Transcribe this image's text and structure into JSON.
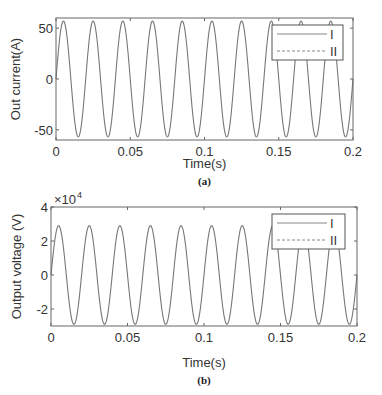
{
  "chart_data": [
    {
      "type": "line",
      "caption": "(a)",
      "title": "",
      "xlabel": "Time(s)",
      "ylabel": "Out current(A)",
      "xlim": [
        0,
        0.2
      ],
      "ylim": [
        -60,
        60
      ],
      "xticks": [
        "0",
        "0.05",
        "0.1",
        "0.15",
        "0.2"
      ],
      "yticks": [
        "-50",
        "0",
        "50"
      ],
      "ytick_values": [
        -50,
        0,
        50
      ],
      "legend": [
        "I",
        "II"
      ],
      "legend_position": "upper right",
      "series": [
        {
          "name": "I",
          "style": "solid",
          "waveform": "sine",
          "amplitude": 57,
          "frequency_hz": 50,
          "phase": 0
        },
        {
          "name": "II",
          "style": "dashed",
          "waveform": "sine",
          "amplitude": 57,
          "frequency_hz": 50,
          "phase": 0
        }
      ],
      "grid": false
    },
    {
      "type": "line",
      "caption": "(b)",
      "title": "",
      "xlabel": "Time(s)",
      "ylabel": "Output voltage (V)",
      "y_multiplier": "×10^4",
      "xlim": [
        0,
        0.2
      ],
      "ylim": [
        -3,
        4
      ],
      "xticks": [
        "0",
        "0.05",
        "0.1",
        "0.15",
        "0.2"
      ],
      "yticks": [
        "-2",
        "0",
        "2",
        "4"
      ],
      "ytick_values": [
        -2,
        0,
        2,
        4
      ],
      "legend": [
        "I",
        "II"
      ],
      "legend_position": "upper right",
      "series": [
        {
          "name": "I",
          "style": "solid",
          "waveform": "sine",
          "amplitude": 2.9,
          "frequency_hz": 50,
          "phase": 0
        },
        {
          "name": "II",
          "style": "dashed",
          "waveform": "sine",
          "amplitude": 2.9,
          "frequency_hz": 50,
          "phase": 0
        }
      ],
      "grid": false
    }
  ]
}
